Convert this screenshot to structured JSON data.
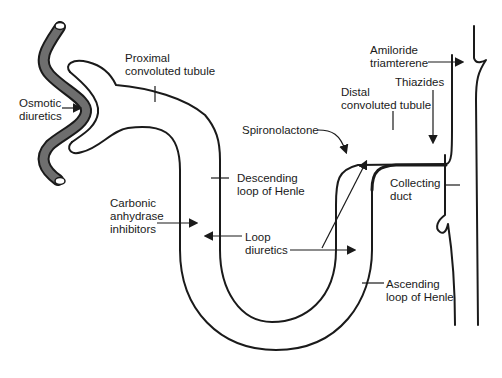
{
  "diagram": {
    "type": "nephron-diuretic-sites",
    "line_color": "#1a1a1a",
    "blood_vessel_fill": "#6e6e6e",
    "structures": [
      {
        "id": "proximal",
        "label": "Proximal\nconvoluted tubule"
      },
      {
        "id": "descending",
        "label": "Descending\nloop of Henle"
      },
      {
        "id": "ascending",
        "label": "Ascending\nloop of Henle"
      },
      {
        "id": "distal",
        "label": "Distal\nconvoluted tubule"
      },
      {
        "id": "collecting",
        "label": "Collecting\nduct"
      }
    ],
    "drugs": [
      {
        "id": "osmotic",
        "label": "Osmotic\ndiuretics"
      },
      {
        "id": "carbonic",
        "label": "Carbonic\nanhydrase\ninhibitors"
      },
      {
        "id": "loop",
        "label": "Loop\ndiuretics"
      },
      {
        "id": "spironolactone",
        "label": "Spironolactone"
      },
      {
        "id": "thiazides",
        "label": "Thiazides"
      },
      {
        "id": "amiloride",
        "label": "Amiloride\ntriamterene"
      }
    ]
  }
}
